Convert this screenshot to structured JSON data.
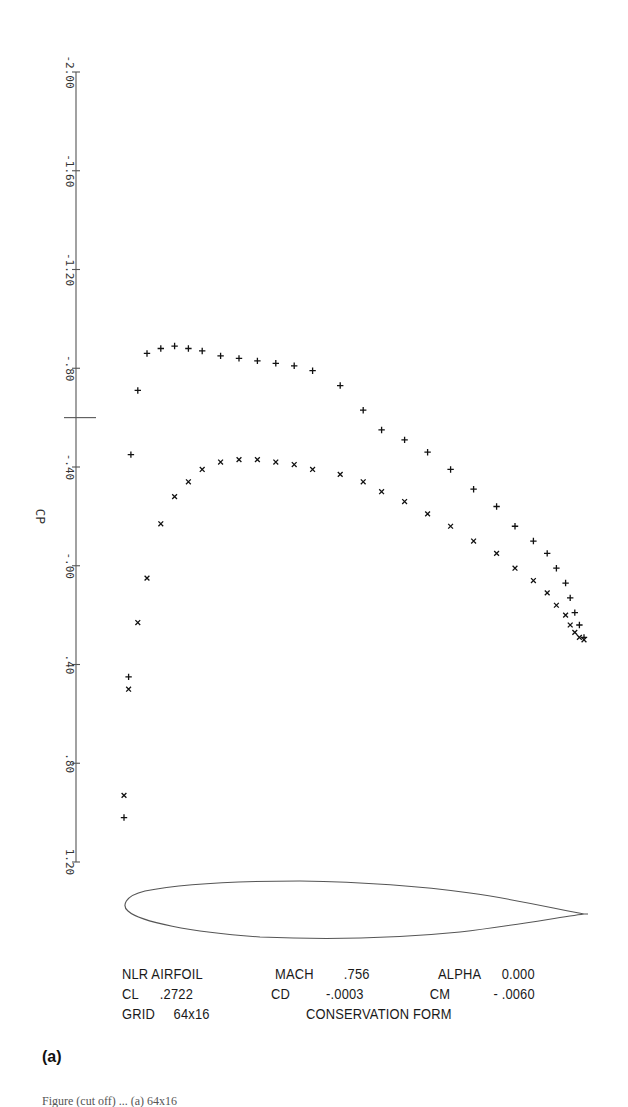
{
  "chart_data": {
    "type": "scatter",
    "title": "",
    "xlabel": "",
    "ylabel": "CP",
    "ylim": [
      -2.0,
      1.2
    ],
    "y_inverted": true,
    "x_axis": "chord fraction x/c (no axis drawn)",
    "yticks": [
      -2.0,
      -1.6,
      -1.2,
      -0.8,
      -0.4,
      0.0,
      0.4,
      0.8,
      1.2
    ],
    "ytick_labels": [
      "-2.00",
      "-1.60",
      "-1.20",
      "-.80",
      "-.40",
      "-.00",
      ".40",
      ".80",
      "1.20"
    ],
    "reference_line": {
      "name": "critical Cp marker",
      "y": -0.6
    },
    "grid": false,
    "legend": "none (markers: + upper surface, x lower surface)",
    "series": [
      {
        "name": "upper surface (+)",
        "marker": "plus",
        "x": [
          0.0,
          0.01,
          0.015,
          0.03,
          0.05,
          0.08,
          0.11,
          0.14,
          0.17,
          0.21,
          0.25,
          0.29,
          0.33,
          0.37,
          0.41,
          0.47,
          0.52,
          0.56,
          0.61,
          0.66,
          0.71,
          0.76,
          0.81,
          0.85,
          0.89,
          0.92,
          0.94,
          0.96,
          0.97,
          0.98,
          0.99,
          1.0
        ],
        "values": [
          1.02,
          0.45,
          -0.45,
          -0.71,
          -0.86,
          -0.88,
          -0.89,
          -0.88,
          -0.87,
          -0.85,
          -0.84,
          -0.83,
          -0.82,
          -0.81,
          -0.79,
          -0.73,
          -0.63,
          -0.55,
          -0.51,
          -0.46,
          -0.39,
          -0.31,
          -0.24,
          -0.16,
          -0.1,
          -0.05,
          0.01,
          0.07,
          0.13,
          0.19,
          0.24,
          0.29
        ]
      },
      {
        "name": "lower surface (x)",
        "marker": "x",
        "x": [
          0.0,
          0.01,
          0.03,
          0.05,
          0.08,
          0.11,
          0.14,
          0.17,
          0.21,
          0.25,
          0.29,
          0.33,
          0.37,
          0.41,
          0.47,
          0.52,
          0.56,
          0.61,
          0.66,
          0.71,
          0.76,
          0.81,
          0.85,
          0.89,
          0.92,
          0.94,
          0.96,
          0.97,
          0.98,
          0.99,
          1.0
        ],
        "values": [
          0.93,
          0.5,
          0.23,
          0.05,
          -0.17,
          -0.28,
          -0.34,
          -0.39,
          -0.42,
          -0.43,
          -0.43,
          -0.42,
          -0.41,
          -0.39,
          -0.37,
          -0.34,
          -0.3,
          -0.26,
          -0.21,
          -0.16,
          -0.1,
          -0.05,
          0.01,
          0.06,
          0.11,
          0.16,
          0.2,
          0.24,
          0.27,
          0.29,
          0.3
        ]
      }
    ],
    "airfoil_outline": "NLR airfoil profile drawn below plot"
  },
  "info": {
    "row1": {
      "c1_key": "NLR AIRFOIL",
      "c1_val": "",
      "c2_key": "MACH",
      "c2_val": ".756",
      "c3_key": "ALPHA",
      "c3_val": "0.000"
    },
    "row2": {
      "c1_key": "CL",
      "c1_val": ".2722",
      "c2_key": "CD",
      "c2_val": "-.0003",
      "c3_key": "CM",
      "c3_val": "- .0060"
    },
    "row3": {
      "c1_key": "GRID",
      "c1_val": "64x16",
      "c2_key": "CONSERVATION FORM",
      "c2_val": "",
      "c3_key": "",
      "c3_val": ""
    }
  },
  "panel_label": "(a)",
  "caption_partial": "Figure (cut off) ... (a) 64x16"
}
